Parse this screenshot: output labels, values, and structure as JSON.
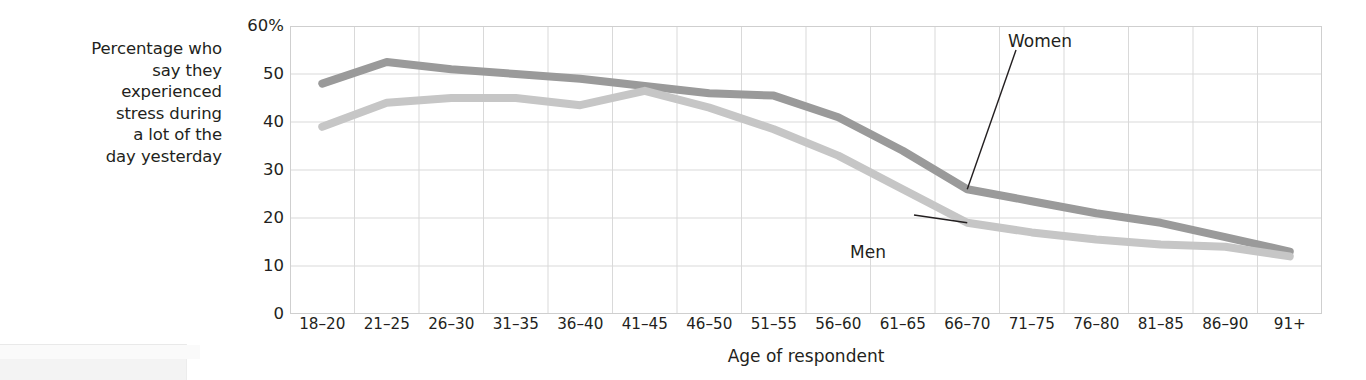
{
  "chart_data": {
    "type": "line",
    "title": "",
    "subtitle": "",
    "xlabel": "Age of respondent",
    "ylabel": "Percentage who say they experienced stress during a lot of the day yesterday",
    "ylabel_lines": [
      "Percentage who",
      "say they",
      "experienced",
      "stress during",
      "a lot of the",
      "day yesterday"
    ],
    "categories": [
      "18–20",
      "21–25",
      "26–30",
      "31–35",
      "36–40",
      "41–45",
      "46–50",
      "51–55",
      "56–60",
      "61–65",
      "66–70",
      "71–75",
      "76–80",
      "81–85",
      "86–90",
      "91+"
    ],
    "series": [
      {
        "name": "Women",
        "color": "#9a9a9a",
        "values": [
          48,
          52.5,
          51,
          50,
          49,
          47.5,
          46,
          45.5,
          41,
          34,
          26,
          23.5,
          21,
          19,
          16,
          13
        ]
      },
      {
        "name": "Men",
        "color": "#c6c6c6",
        "values": [
          39,
          44,
          45,
          45,
          43.5,
          46.5,
          43,
          38.5,
          33,
          26,
          19,
          17,
          15.5,
          14.5,
          14,
          12
        ]
      }
    ],
    "ylim": [
      0,
      60
    ],
    "yticks": [
      0,
      10,
      20,
      30,
      40,
      50,
      60
    ],
    "ytick_labels": [
      "0",
      "10",
      "20",
      "30",
      "40",
      "50",
      "60%"
    ],
    "grid": true,
    "grid_color": "#d9d9d9",
    "legend": "inline-annotations",
    "annotations": [
      {
        "text": "Women",
        "series": "Women",
        "anchor_category": "66–70"
      },
      {
        "text": "Men",
        "series": "Men",
        "anchor_category": "66–70"
      }
    ]
  }
}
